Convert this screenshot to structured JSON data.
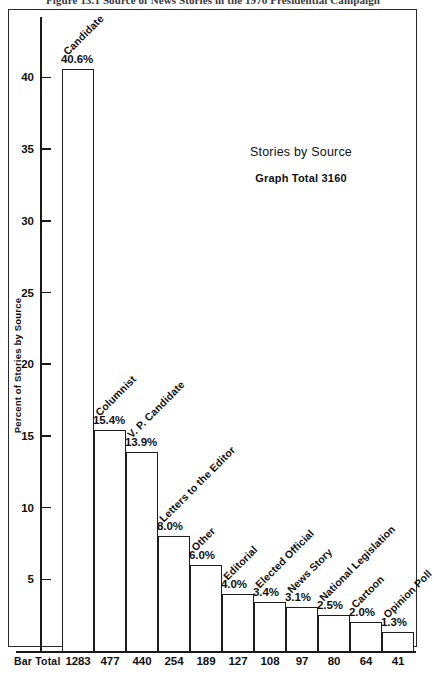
{
  "figure": {
    "caption": "Figure 13.1   Source of News Stories in the 1976 Presidential Campaign"
  },
  "annotation": {
    "title": "Stories by Source",
    "subtitle": "Graph Total  3160"
  },
  "footer": {
    "row_label": "Bar Total"
  },
  "chart_data": {
    "type": "bar",
    "title": "Stories by Source",
    "xlabel": "",
    "ylabel": "Percent of Stories by Source",
    "ylim": [
      0,
      42
    ],
    "grid": false,
    "legend": "none",
    "graph_total": 3160,
    "y_ticks": [
      5,
      10,
      15,
      20,
      25,
      30,
      35,
      40
    ],
    "y_tick_labels": [
      "5",
      "10",
      "15",
      "20",
      "25",
      "30",
      "35",
      "40"
    ],
    "categories": [
      "Candidate",
      "Columnist",
      "V. P. Candidate",
      "Letters to the Editor",
      "Other",
      "Editorial",
      "Elected Official",
      "News Story",
      "National Legislation",
      "Cartoon",
      "Opinion Poll"
    ],
    "values": [
      40.6,
      15.4,
      13.9,
      8.0,
      6.0,
      4.0,
      3.4,
      3.1,
      2.5,
      2.0,
      1.3
    ],
    "value_labels": [
      "40.6%",
      "15.4%",
      "13.9%",
      "8.0%",
      "6.0%",
      "4.0%",
      "3.4%",
      "3.1%",
      "2.5%",
      "2.0%",
      "1.3%"
    ],
    "bar_totals": [
      1283,
      477,
      440,
      254,
      189,
      127,
      108,
      97,
      80,
      64,
      41
    ],
    "bar_total_labels": [
      "1283",
      "477",
      "440",
      "254",
      "189",
      "127",
      "108",
      "97",
      "80",
      "64",
      "41"
    ]
  }
}
